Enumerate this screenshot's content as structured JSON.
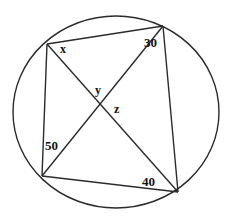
{
  "figure": {
    "type": "cyclic-quadrilateral-with-diagonals",
    "width": 239,
    "height": 222,
    "background_color": "#ffffff",
    "stroke_color": "#2b2b2b",
    "label_color": "#111111"
  },
  "circle": {
    "name": "circumscribed-circle",
    "cx": 116,
    "cy": 112,
    "rx": 103,
    "ry": 96,
    "stroke_width": 1.4
  },
  "vertices": [
    {
      "id": "A",
      "x": 47,
      "y": 44,
      "position": "top-left"
    },
    {
      "id": "B",
      "x": 163,
      "y": 26,
      "position": "top-right"
    },
    {
      "id": "C",
      "x": 178,
      "y": 192,
      "position": "bottom-right"
    },
    {
      "id": "D",
      "x": 42,
      "y": 176,
      "position": "bottom-left"
    }
  ],
  "intersection": {
    "id": "P",
    "x": 101,
    "y": 105
  },
  "segments": [
    {
      "name": "chord-top",
      "from": "A",
      "to": "B"
    },
    {
      "name": "chord-right",
      "from": "B",
      "to": "C"
    },
    {
      "name": "chord-bottom",
      "from": "C",
      "to": "D"
    },
    {
      "name": "chord-left",
      "from": "A",
      "to": "D"
    },
    {
      "name": "diagonal-a-c",
      "from": "A",
      "to": "C"
    },
    {
      "name": "diagonal-b-d",
      "from": "B",
      "to": "D"
    }
  ],
  "labels": {
    "x": "x",
    "y": "y",
    "z": "z",
    "a30": "30",
    "a40": "40",
    "a50": "50"
  }
}
